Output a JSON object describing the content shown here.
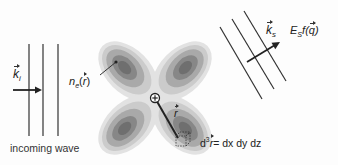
{
  "diagram": {
    "incoming": {
      "label": "incoming wave",
      "wavevector_symbol": "k",
      "wavevector_subscript": "i"
    },
    "density": {
      "symbol": "n",
      "subscript": "e",
      "argument": "(r)",
      "arg_letter": "r"
    },
    "nucleus": {
      "symbol": "+"
    },
    "position": {
      "symbol": "r"
    },
    "volume_element": {
      "prefix": "d",
      "power": "3",
      "var": "r",
      "rhs": "= dx dy dz"
    },
    "scattered": {
      "wavevector_symbol": "k",
      "wavevector_subscript": "s",
      "amplitude_E": "E",
      "amplitude_sub": "S",
      "amplitude_f": "f(",
      "amplitude_q": "q",
      "amplitude_close": ")"
    },
    "colors": {
      "line": "#333333",
      "lobe_outer": "#d6d6d6",
      "lobe_mid": "#b4b4b4",
      "lobe_inner": "#8e8e8e",
      "lobe_core": "#6e6e6e"
    }
  }
}
